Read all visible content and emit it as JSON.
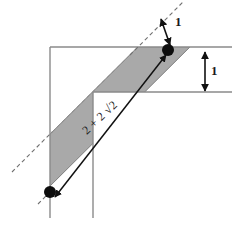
{
  "figure": {
    "labels": {
      "top_offset": "1",
      "right_height": "1",
      "diagonal_length": "2 + 2 √2"
    },
    "colors": {
      "band_fill": "#a9a9a9",
      "band_stroke": "#8c8c8c",
      "outline": "#8a8a8a",
      "ink": "#1a1a1a",
      "background": "#ffffff"
    },
    "geometry": {
      "l_shape": {
        "outer_top_left": [
          50,
          47
        ],
        "outer_top_right": [
          232,
          47
        ],
        "inner_corner": [
          93,
          92
        ],
        "inner_right": [
          232,
          92
        ],
        "outer_bottom_left": [
          50,
          218
        ],
        "inner_bottom": [
          93,
          218
        ]
      },
      "band": {
        "comment": "45-degree parallelogram band clipped to the L-shaped region",
        "upper_dashed_line": [
          [
            14,
            170
          ],
          [
            183,
            2
          ]
        ],
        "lower_line": [
          [
            36,
            196
          ],
          [
            200,
            34
          ]
        ]
      },
      "dots": [
        {
          "name": "upper-vertex",
          "cx": 168,
          "cy": 50,
          "r": 6
        },
        {
          "name": "lower-vertex",
          "cx": 50,
          "cy": 192,
          "r": 6
        }
      ],
      "arrows": {
        "top_offset_arrow": {
          "from": [
            160,
            19
          ],
          "to": [
            170,
            46
          ]
        },
        "right_height_arrow": {
          "x": 205,
          "y1": 51,
          "y2": 92
        },
        "diagonal_arrow": {
          "from": [
            54,
            196
          ],
          "to": [
            166,
            54
          ]
        }
      }
    }
  }
}
